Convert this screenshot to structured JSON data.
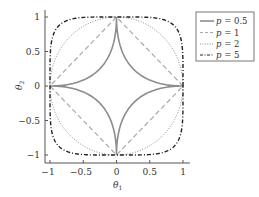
{
  "chart_data": {
    "type": "line",
    "title": "",
    "xlabel": "θ1",
    "ylabel": "θ2",
    "xlim": [
      -1,
      1
    ],
    "ylim": [
      -1,
      1
    ],
    "grid": false,
    "legend_position": "upper right, outside plot",
    "x_ticks": [
      "-1",
      "-0.5",
      "0",
      "0.5",
      "1"
    ],
    "y_ticks": [
      "-1",
      "-0.5",
      "0",
      "0.5",
      "1"
    ],
    "series": [
      {
        "name": "p = 0.5",
        "p": 0.5,
        "style": "solid",
        "color": "#8c8c8c"
      },
      {
        "name": "p = 1",
        "p": 1,
        "style": "dashed",
        "color": "#a8a8a8"
      },
      {
        "name": "p = 2",
        "p": 2,
        "style": "dotted",
        "color": "#8c8c8c"
      },
      {
        "name": "p = 5",
        "p": 5,
        "style": "dashdot",
        "color": "#222222"
      }
    ]
  },
  "axes": {
    "xlabel_main": "θ",
    "xlabel_sub": "1",
    "ylabel_main": "θ",
    "ylabel_sub": "2",
    "x_tick_labels": [
      "−1",
      "−0.5",
      "0",
      "0.5",
      "1"
    ],
    "y_tick_labels": [
      "1",
      "0.5",
      "0",
      "−0.5",
      "−1"
    ]
  },
  "legend": {
    "items": [
      {
        "var": "p",
        "eq": " = ",
        "value": "0.5"
      },
      {
        "var": "p",
        "eq": " = ",
        "value": "1"
      },
      {
        "var": "p",
        "eq": " = ",
        "value": "2"
      },
      {
        "var": "p",
        "eq": " = ",
        "value": "5"
      }
    ]
  }
}
